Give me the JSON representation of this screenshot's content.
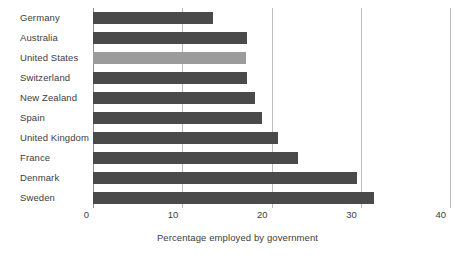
{
  "chart_data": {
    "type": "bar",
    "orientation": "horizontal",
    "title": "",
    "xlabel": "Percentage employed by government",
    "ylabel": "",
    "xlim": [
      0,
      40
    ],
    "xticks": [
      0,
      10,
      20,
      30,
      40
    ],
    "xtick_labels": [
      "0",
      "10",
      "20",
      "30",
      "40"
    ],
    "grid": true,
    "legend": "none",
    "categories": [
      "Germany",
      "Australia",
      "United States",
      "Switzerland",
      "New Zealand",
      "Spain",
      "United Kingdom",
      "France",
      "Denmark",
      "Sweden"
    ],
    "values": [
      13.4,
      17.2,
      17.1,
      17.3,
      18.2,
      18.9,
      20.7,
      23.0,
      29.6,
      31.5
    ],
    "highlight_index": 2,
    "colors": {
      "bar": "#4a4a4a",
      "bar_highlight": "#9b9b9b",
      "gridline": "#bcbcbc",
      "axis": "#8d8d8d",
      "text": "#3d3d3d",
      "background": "#ffffff"
    }
  }
}
